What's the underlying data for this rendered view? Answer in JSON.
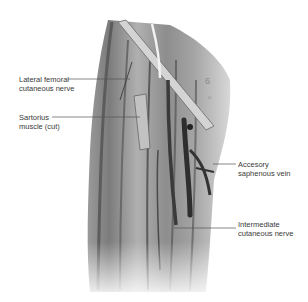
{
  "figure": {
    "labels": [
      {
        "id": "lateral-femoral-cutaneous-nerve",
        "line1": "Lateral femoral",
        "line2": "cutaneous nerve",
        "side": "left"
      },
      {
        "id": "sartorius-muscle",
        "line1": "Sartorius",
        "line2": "muscle (cut)",
        "side": "left"
      },
      {
        "id": "accessory-saphenous-vein",
        "line1": "Accesory",
        "line2": "saphenous vein",
        "side": "right"
      },
      {
        "id": "intermediate-cutaneous-nerve",
        "line1": "Intermediate",
        "line2": "cutaneous nerve",
        "side": "right"
      }
    ],
    "colors": {
      "background": "#ffffff",
      "muscle_light": "#bdbdbd",
      "muscle_mid": "#8a8a8a",
      "muscle_dark": "#4a4a4a",
      "vessel": "#3a3a3a",
      "text": "#3a3a3a",
      "leader_line": "#555555"
    }
  }
}
